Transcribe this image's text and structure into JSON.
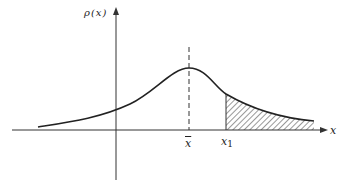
{
  "diagram": {
    "type": "probability-density-plot",
    "y_axis_label": "ρ(x)",
    "x_axis_label": "x",
    "mean_label": "x",
    "mean_label_decoration": "overline",
    "threshold_label": "x",
    "threshold_subscript": "1",
    "curve": "bell-shaped density with heavy right tail",
    "shaded_region": "tail area to the right of x1 (hatched)",
    "mean_marker": "dashed vertical line at peak",
    "colors": {
      "line": "#222222",
      "background": "#ffffff",
      "hatch": "#333333"
    }
  }
}
